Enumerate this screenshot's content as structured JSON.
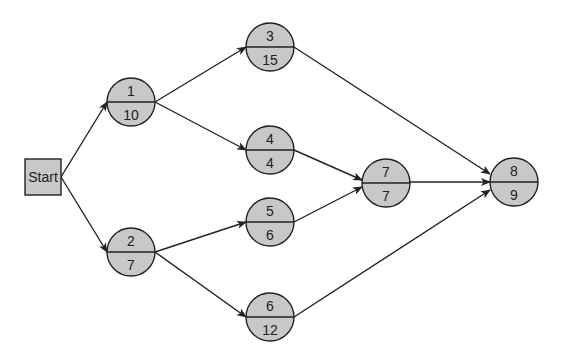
{
  "diagram": {
    "type": "activity-on-node network",
    "colors": {
      "node_fill": "#c8c8c8",
      "stroke": "#222222",
      "background": "#ffffff"
    },
    "start": {
      "label": "Start",
      "x": 43,
      "y": 177,
      "w": 36,
      "h": 36
    },
    "nodes": [
      {
        "id": "1",
        "top": "1",
        "bottom": "10",
        "cx": 131,
        "cy": 102
      },
      {
        "id": "2",
        "top": "2",
        "bottom": "7",
        "cx": 131,
        "cy": 252
      },
      {
        "id": "3",
        "top": "3",
        "bottom": "15",
        "cx": 270,
        "cy": 47
      },
      {
        "id": "4",
        "top": "4",
        "bottom": "4",
        "cx": 270,
        "cy": 150
      },
      {
        "id": "5",
        "top": "5",
        "bottom": "6",
        "cx": 270,
        "cy": 222
      },
      {
        "id": "6",
        "top": "6",
        "bottom": "12",
        "cx": 270,
        "cy": 317
      },
      {
        "id": "7",
        "top": "7",
        "bottom": "7",
        "cx": 386,
        "cy": 183
      },
      {
        "id": "8",
        "top": "8",
        "bottom": "9",
        "cx": 514,
        "cy": 182
      }
    ],
    "edges": [
      {
        "from": "Start",
        "to": "1"
      },
      {
        "from": "Start",
        "to": "2"
      },
      {
        "from": "1",
        "to": "3"
      },
      {
        "from": "1",
        "to": "4"
      },
      {
        "from": "2",
        "to": "5"
      },
      {
        "from": "2",
        "to": "6"
      },
      {
        "from": "3",
        "to": "8"
      },
      {
        "from": "4",
        "to": "7"
      },
      {
        "from": "5",
        "to": "7"
      },
      {
        "from": "7",
        "to": "8"
      },
      {
        "from": "6",
        "to": "8"
      }
    ]
  }
}
